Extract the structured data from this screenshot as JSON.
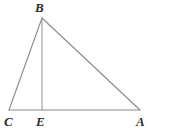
{
  "figure": {
    "kind": "plane-geometry-diagram",
    "background_color": "#ffffff",
    "stroke_color": "#8a8a8a",
    "label_color": "#2b2b2b",
    "canvas": {
      "width": 169,
      "height": 135
    },
    "points": [
      {
        "name": "B",
        "label": "B",
        "x": 42,
        "y": 18
      },
      {
        "name": "C",
        "label": "C",
        "x": 9,
        "y": 110
      },
      {
        "name": "E",
        "label": "E",
        "x": 42,
        "y": 110
      },
      {
        "name": "A",
        "label": "A",
        "x": 140,
        "y": 110
      }
    ],
    "segments": [
      {
        "name": "segment-CB",
        "from": "C",
        "to": "B",
        "stroke": "#8a8a8a",
        "width": 1.1
      },
      {
        "name": "segment-BA",
        "from": "B",
        "to": "A",
        "stroke": "#8a8a8a",
        "width": 1.1
      },
      {
        "name": "segment-CA",
        "from": "C",
        "to": "A",
        "stroke": "#8a8a8a",
        "width": 1.1
      },
      {
        "name": "segment-BE",
        "from": "B",
        "to": "E",
        "stroke": "#9b9b9b",
        "width": 1.1
      }
    ],
    "labels": {
      "B": "B",
      "C": "C",
      "E": "E",
      "A": "A"
    }
  }
}
